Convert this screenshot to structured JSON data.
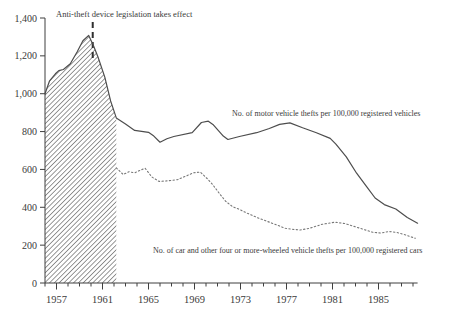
{
  "figure": {
    "background": "#ffffff",
    "text_color": "#3a3a3a",
    "annotation_label": "Anti-theft device legislation takes effect",
    "series1_label": "No. of motor vehicle thefts per 100,000 registered vehicles",
    "series2_label": "No. of car and other four or more-wheeled vehicle thefts per 100,000 registered cars"
  },
  "chart_data": {
    "type": "line",
    "title": "",
    "xlabel": "",
    "ylabel": "",
    "x_axis": {
      "range": [
        1956,
        1988.4
      ],
      "major_tick_years": [
        1957,
        1961,
        1965,
        1969,
        1973,
        1977,
        1981,
        1985
      ],
      "major_tick_labels": [
        "1957",
        "1961",
        "1965",
        "1969",
        "1973",
        "1977",
        "1981",
        "1985"
      ],
      "minor_tick_interval_years": 1
    },
    "y_axis": {
      "range": [
        0,
        1400
      ],
      "tick_interval": 200,
      "tick_values": [
        0,
        200,
        400,
        600,
        800,
        1000,
        1200,
        1400
      ],
      "tick_labels": [
        "0",
        "200",
        "400",
        "600",
        "800",
        "1,000",
        "1,200",
        "1,400"
      ]
    },
    "grid": false,
    "legend": "inline-labels-next-to-curves",
    "annotation": {
      "text": "Anti-theft device legislation takes effect",
      "line_year": 1960.15,
      "line_style": "dashed-vertical",
      "line_color": "#2f2f2f"
    },
    "hatched_region": {
      "description": "diagonal-hatch fill under the solid curve from the y-axis until shortly after the legislation line",
      "from_year": 1956,
      "to_year": 1962.2,
      "hatch_color": "#303030"
    },
    "series": [
      {
        "name": "No. of motor vehicle thefts per 100,000 registered vehicles",
        "style": "solid",
        "color": "#4d4d4d",
        "points": [
          [
            1956,
            1000
          ],
          [
            1956.4,
            1068
          ],
          [
            1956.9,
            1105
          ],
          [
            1957.2,
            1122
          ],
          [
            1957.6,
            1128
          ],
          [
            1958.2,
            1158
          ],
          [
            1958.8,
            1222
          ],
          [
            1959.3,
            1280
          ],
          [
            1959.8,
            1308
          ],
          [
            1960.2,
            1256
          ],
          [
            1960.6,
            1195
          ],
          [
            1961.2,
            1088
          ],
          [
            1961.7,
            962
          ],
          [
            1962.2,
            872
          ],
          [
            1963,
            840
          ],
          [
            1963.8,
            806
          ],
          [
            1965,
            796
          ],
          [
            1965.4,
            780
          ],
          [
            1966,
            744
          ],
          [
            1966.6,
            762
          ],
          [
            1967.2,
            774
          ],
          [
            1968.8,
            794
          ],
          [
            1969.6,
            848
          ],
          [
            1970.2,
            855
          ],
          [
            1970.6,
            838
          ],
          [
            1971.5,
            776
          ],
          [
            1971.9,
            758
          ],
          [
            1972.9,
            774
          ],
          [
            1974.4,
            794
          ],
          [
            1975.5,
            816
          ],
          [
            1976.4,
            838
          ],
          [
            1977.3,
            846
          ],
          [
            1978.4,
            820
          ],
          [
            1979.6,
            794
          ],
          [
            1980.8,
            764
          ],
          [
            1981.3,
            734
          ],
          [
            1982.2,
            666
          ],
          [
            1983.1,
            580
          ],
          [
            1984,
            506
          ],
          [
            1984.7,
            449
          ],
          [
            1985.5,
            414
          ],
          [
            1986.5,
            391
          ],
          [
            1987.5,
            346
          ],
          [
            1988.4,
            316
          ]
        ]
      },
      {
        "name": "No. of car and other four or more-wheeled vehicle thefts per 100,000 registered cars",
        "style": "dotted",
        "color": "#787878",
        "points": [
          [
            1962.2,
            608
          ],
          [
            1962.8,
            573
          ],
          [
            1963.3,
            588
          ],
          [
            1963.8,
            582
          ],
          [
            1964.3,
            596
          ],
          [
            1964.7,
            606
          ],
          [
            1965.3,
            560
          ],
          [
            1965.9,
            537
          ],
          [
            1966.7,
            540
          ],
          [
            1967.5,
            546
          ],
          [
            1968.3,
            566
          ],
          [
            1968.9,
            582
          ],
          [
            1969.5,
            586
          ],
          [
            1970.1,
            552
          ],
          [
            1970.6,
            518
          ],
          [
            1971.2,
            470
          ],
          [
            1971.7,
            432
          ],
          [
            1972.3,
            404
          ],
          [
            1973,
            386
          ],
          [
            1973.6,
            368
          ],
          [
            1974.6,
            342
          ],
          [
            1975.8,
            315
          ],
          [
            1976.9,
            289
          ],
          [
            1977.6,
            283
          ],
          [
            1978.2,
            280
          ],
          [
            1979,
            289
          ],
          [
            1980.1,
            310
          ],
          [
            1981.2,
            321
          ],
          [
            1982.1,
            314
          ],
          [
            1983.4,
            289
          ],
          [
            1984.5,
            268
          ],
          [
            1985.2,
            264
          ],
          [
            1985.9,
            272
          ],
          [
            1986.6,
            267
          ],
          [
            1987.3,
            255
          ],
          [
            1988.2,
            236
          ]
        ]
      }
    ]
  }
}
